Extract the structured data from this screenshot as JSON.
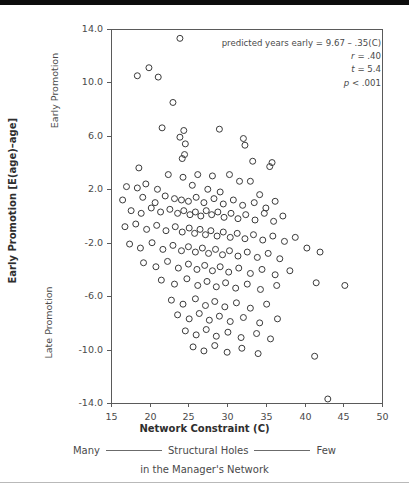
{
  "figure": {
    "background": "#ffffff",
    "topbar_color": "#0d0d0d",
    "frame_color": "#5a5a5a",
    "marker_color": "#3a3a3a"
  },
  "annotation": {
    "line1": "predicted years early = 9.67 – .35(C)",
    "line2_stat": "r",
    "line2_value": "= .40",
    "line3_stat": "t",
    "line3_value": "= 5.4",
    "line4_stat": "p",
    "line4_value": "< .001"
  },
  "axes": {
    "y_title": "Early Promotion [E(age)–age]",
    "y_top_label": "Early Promotion",
    "y_bottom_label": "Late Promotion",
    "x_title": "Network Constraint (C)",
    "x_sub_left": "Many",
    "x_sub_mid": "Structural Holes",
    "x_sub_right": "Few",
    "x_sub_line2": "in the Manager's Network"
  },
  "chart_data": {
    "type": "scatter",
    "title": "",
    "xlabel": "Network Constraint (C)",
    "ylabel": "Early Promotion [E(age)–age]",
    "xlim": [
      15,
      50
    ],
    "ylim": [
      -14.0,
      14.0
    ],
    "xticks": [
      15,
      20,
      25,
      30,
      35,
      40,
      45,
      50
    ],
    "xtick_labels": [
      "15",
      "20",
      "25",
      "30",
      "35",
      "40",
      "45",
      "50"
    ],
    "yticks": [
      14.0,
      10.0,
      6.0,
      2.0,
      -2.0,
      -6.0,
      -10.0,
      -14.0
    ],
    "ytick_labels": [
      "14.0",
      "10.0",
      "6.0",
      "2.0",
      "-2.0",
      "-6.0",
      "-10.0",
      "-14.0"
    ],
    "grid": false,
    "legend": null,
    "marker": "open-circle",
    "marker_size_px": 6,
    "regression": {
      "intercept": 9.67,
      "slope": -0.35,
      "r": 0.4,
      "t": 5.4,
      "p": "< .001",
      "drawn": false
    },
    "n_points": 172,
    "points": [
      [
        23.9,
        13.3
      ],
      [
        18.4,
        10.5
      ],
      [
        19.9,
        11.1
      ],
      [
        21.1,
        10.4
      ],
      [
        23.0,
        8.5
      ],
      [
        21.6,
        6.6
      ],
      [
        24.4,
        6.4
      ],
      [
        23.9,
        5.9
      ],
      [
        24.6,
        5.4
      ],
      [
        24.5,
        4.6
      ],
      [
        24.2,
        4.3
      ],
      [
        29.0,
        6.5
      ],
      [
        32.1,
        5.8
      ],
      [
        32.3,
        5.3
      ],
      [
        18.6,
        3.6
      ],
      [
        33.3,
        4.1
      ],
      [
        35.8,
        4.0
      ],
      [
        35.5,
        3.7
      ],
      [
        22.4,
        3.1
      ],
      [
        24.3,
        2.9
      ],
      [
        26.2,
        3.1
      ],
      [
        28.1,
        3.0
      ],
      [
        30.3,
        3.1
      ],
      [
        31.6,
        2.6
      ],
      [
        17.0,
        2.2
      ],
      [
        18.4,
        2.1
      ],
      [
        19.5,
        2.4
      ],
      [
        21.0,
        2.0
      ],
      [
        25.5,
        2.3
      ],
      [
        27.5,
        2.0
      ],
      [
        29.1,
        1.8
      ],
      [
        33.0,
        2.6
      ],
      [
        34.2,
        1.6
      ],
      [
        16.5,
        1.2
      ],
      [
        19.1,
        1.4
      ],
      [
        20.7,
        1.0
      ],
      [
        22.0,
        1.5
      ],
      [
        23.2,
        1.3
      ],
      [
        24.1,
        1.2
      ],
      [
        25.0,
        1.1
      ],
      [
        26.0,
        1.4
      ],
      [
        27.0,
        1.0
      ],
      [
        28.3,
        1.3
      ],
      [
        29.5,
        0.9
      ],
      [
        30.8,
        1.2
      ],
      [
        32.0,
        0.8
      ],
      [
        33.5,
        1.0
      ],
      [
        35.0,
        0.6
      ],
      [
        36.2,
        1.1
      ],
      [
        17.6,
        0.4
      ],
      [
        18.9,
        0.2
      ],
      [
        20.2,
        0.6
      ],
      [
        21.4,
        0.3
      ],
      [
        22.6,
        0.5
      ],
      [
        23.6,
        0.2
      ],
      [
        24.4,
        0.4
      ],
      [
        25.2,
        0.1
      ],
      [
        25.9,
        0.3
      ],
      [
        26.6,
        0.0
      ],
      [
        27.3,
        0.4
      ],
      [
        28.0,
        0.1
      ],
      [
        28.8,
        0.3
      ],
      [
        29.6,
        -0.1
      ],
      [
        30.5,
        0.2
      ],
      [
        31.4,
        -0.2
      ],
      [
        32.4,
        0.1
      ],
      [
        33.6,
        -0.3
      ],
      [
        34.8,
        0.2
      ],
      [
        36.0,
        -0.4
      ],
      [
        37.2,
        0.0
      ],
      [
        16.8,
        -0.8
      ],
      [
        18.2,
        -0.6
      ],
      [
        19.6,
        -1.0
      ],
      [
        20.9,
        -0.7
      ],
      [
        22.1,
        -1.1
      ],
      [
        23.3,
        -0.8
      ],
      [
        24.2,
        -1.2
      ],
      [
        25.1,
        -0.9
      ],
      [
        25.8,
        -1.3
      ],
      [
        26.5,
        -1.0
      ],
      [
        27.2,
        -1.4
      ],
      [
        27.9,
        -1.1
      ],
      [
        28.7,
        -1.5
      ],
      [
        29.5,
        -1.2
      ],
      [
        30.4,
        -1.6
      ],
      [
        31.3,
        -1.3
      ],
      [
        32.3,
        -1.7
      ],
      [
        33.4,
        -1.4
      ],
      [
        34.6,
        -1.8
      ],
      [
        35.9,
        -1.5
      ],
      [
        37.4,
        -1.9
      ],
      [
        38.8,
        -1.6
      ],
      [
        17.4,
        -2.1
      ],
      [
        18.8,
        -2.4
      ],
      [
        20.3,
        -2.0
      ],
      [
        21.7,
        -2.5
      ],
      [
        23.0,
        -2.2
      ],
      [
        24.1,
        -2.6
      ],
      [
        25.0,
        -2.3
      ],
      [
        25.9,
        -2.7
      ],
      [
        26.8,
        -2.4
      ],
      [
        27.6,
        -2.8
      ],
      [
        28.5,
        -2.5
      ],
      [
        29.4,
        -2.9
      ],
      [
        30.3,
        -2.6
      ],
      [
        31.4,
        -3.0
      ],
      [
        32.6,
        -2.7
      ],
      [
        33.9,
        -3.1
      ],
      [
        35.3,
        -2.8
      ],
      [
        36.8,
        -3.2
      ],
      [
        40.3,
        -2.4
      ],
      [
        42.0,
        -2.7
      ],
      [
        19.2,
        -3.5
      ],
      [
        20.8,
        -3.8
      ],
      [
        22.3,
        -3.4
      ],
      [
        23.7,
        -3.9
      ],
      [
        25.0,
        -3.6
      ],
      [
        26.1,
        -4.0
      ],
      [
        27.1,
        -3.7
      ],
      [
        28.1,
        -4.1
      ],
      [
        29.1,
        -3.8
      ],
      [
        30.2,
        -4.2
      ],
      [
        31.5,
        -3.9
      ],
      [
        33.0,
        -4.3
      ],
      [
        34.5,
        -4.0
      ],
      [
        36.2,
        -4.4
      ],
      [
        38.1,
        -4.1
      ],
      [
        21.5,
        -4.8
      ],
      [
        23.2,
        -5.1
      ],
      [
        24.8,
        -4.7
      ],
      [
        26.2,
        -5.2
      ],
      [
        27.4,
        -4.9
      ],
      [
        28.6,
        -5.3
      ],
      [
        29.8,
        -5.0
      ],
      [
        31.1,
        -5.4
      ],
      [
        32.6,
        -5.1
      ],
      [
        34.3,
        -5.5
      ],
      [
        36.4,
        -5.2
      ],
      [
        41.5,
        -5.0
      ],
      [
        45.2,
        -5.2
      ],
      [
        22.8,
        -6.3
      ],
      [
        24.3,
        -6.6
      ],
      [
        25.9,
        -6.2
      ],
      [
        27.2,
        -6.7
      ],
      [
        28.4,
        -6.4
      ],
      [
        29.7,
        -6.8
      ],
      [
        31.2,
        -6.5
      ],
      [
        33.0,
        -6.9
      ],
      [
        35.1,
        -6.6
      ],
      [
        23.6,
        -7.4
      ],
      [
        25.1,
        -7.7
      ],
      [
        26.4,
        -7.3
      ],
      [
        27.7,
        -7.8
      ],
      [
        29.0,
        -7.5
      ],
      [
        30.4,
        -7.9
      ],
      [
        32.1,
        -7.6
      ],
      [
        34.2,
        -8.0
      ],
      [
        36.5,
        -7.7
      ],
      [
        24.6,
        -8.6
      ],
      [
        26.0,
        -8.9
      ],
      [
        27.3,
        -8.5
      ],
      [
        28.6,
        -9.0
      ],
      [
        30.1,
        -8.7
      ],
      [
        31.8,
        -9.1
      ],
      [
        33.8,
        -8.8
      ],
      [
        35.6,
        -9.2
      ],
      [
        25.6,
        -9.8
      ],
      [
        27.0,
        -10.1
      ],
      [
        28.4,
        -9.7
      ],
      [
        30.0,
        -10.2
      ],
      [
        31.9,
        -9.9
      ],
      [
        34.0,
        -10.3
      ],
      [
        41.3,
        -10.5
      ],
      [
        43.0,
        -13.7
      ]
    ]
  }
}
